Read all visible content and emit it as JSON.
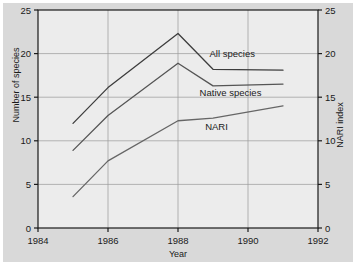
{
  "chart_data": {
    "type": "line",
    "title": "",
    "subtitle": "",
    "xlabel": "Year",
    "ylabel": "Number of species",
    "y2label": "NARI index",
    "xlim": [
      1984,
      1992
    ],
    "ylim": [
      0,
      25
    ],
    "y2lim": [
      0,
      25
    ],
    "xticks": [
      1984,
      1986,
      1988,
      1990,
      1992
    ],
    "xticklabels": [
      "1984",
      "1986",
      "1988",
      "1990",
      "1992"
    ],
    "yticks": [
      0,
      5,
      10,
      15,
      20,
      25
    ],
    "yticklabels": [
      "0",
      "5",
      "10",
      "15",
      "20",
      "25"
    ],
    "y2ticks": [
      0,
      5,
      10,
      15,
      20,
      25
    ],
    "y2ticklabels": [
      "0",
      "5",
      "10",
      "15",
      "20",
      "25"
    ],
    "grid": true,
    "grid_axes": "both",
    "legend": "inline-labels",
    "legend_position": "right-of-lines",
    "x": [
      1985,
      1986,
      1988,
      1989,
      1991
    ],
    "series": [
      {
        "name": "All species",
        "axis": "left",
        "color": "#3d3d3d",
        "values": [
          12.0,
          16.1,
          22.3,
          18.2,
          18.1
        ]
      },
      {
        "name": "Native species",
        "axis": "left",
        "color": "#555555",
        "values": [
          8.9,
          12.9,
          18.9,
          16.3,
          16.5
        ]
      },
      {
        "name": "NARI",
        "axis": "right",
        "color": "#666666",
        "values": [
          3.6,
          7.7,
          12.3,
          12.6,
          14.0
        ]
      }
    ],
    "annotations": [
      {
        "text": "All species",
        "x": 1989.55,
        "y": 19.6
      },
      {
        "text": "Native species",
        "x": 1989.5,
        "y": 15.1
      },
      {
        "text": "NARI",
        "x": 1989.1,
        "y": 11.2
      }
    ]
  },
  "style": {
    "figure_background": "#d9d9d9",
    "plot_background": "#ececec",
    "axis_color": "#1a1a1a",
    "grid_color": "#9a9a9a",
    "tick_label_color": "#1a1a1a"
  }
}
